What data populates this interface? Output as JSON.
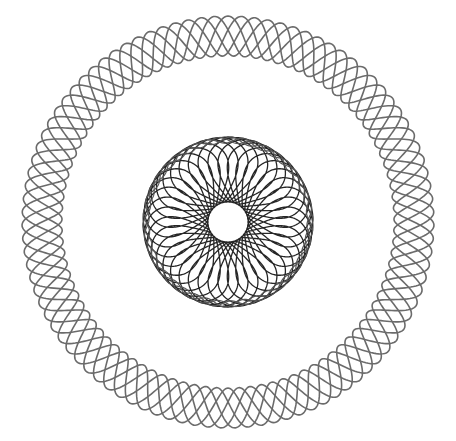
{
  "image": {
    "width": 456,
    "height": 441,
    "background": "#ffffff",
    "description": "Spirograph drawing: outer wavy braided ring and dense inner rosette"
  },
  "outer_ring": {
    "center": [
      228,
      222
    ],
    "base_radius": 186,
    "amplitude": 20,
    "lobes": 19,
    "strands": 5,
    "stroke": "#6b6b6b",
    "stroke_width": 1.6
  },
  "inner_rosette": {
    "center": [
      228,
      222
    ],
    "R": 52,
    "r": 33,
    "loops": 38,
    "hole_radius": 20,
    "outer_radius": 85,
    "stroke": "#262626",
    "stroke_width": 1.3
  }
}
